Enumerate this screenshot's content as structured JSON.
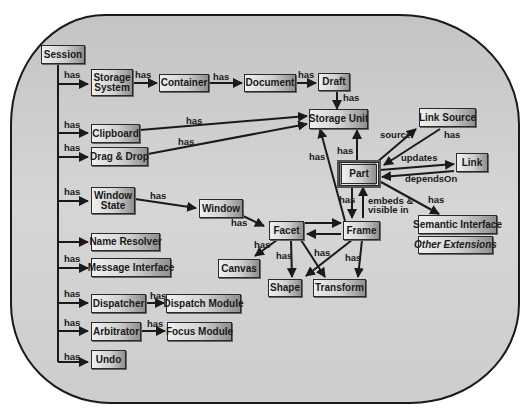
{
  "diagram": {
    "nodes": {
      "session": "Session",
      "storage_system": "Storage System",
      "container": "Container",
      "document": "Document",
      "draft": "Draft",
      "storage_unit": "Storage Unit",
      "clipboard": "Clipboard",
      "drag_drop": "Drag & Drop",
      "window_state": "Window State",
      "window": "Window",
      "facet": "Facet",
      "frame": "Frame",
      "part": "Part",
      "link_source": "Link Source",
      "link": "Link",
      "semantic_interface": "Semantic Interface",
      "other_extensions": "Other Extensions",
      "canvas": "Canvas",
      "shape": "Shape",
      "transform": "Transform",
      "name_resolver": "Name Resolver",
      "message_interface": "Message Interface",
      "dispatcher": "Dispatcher",
      "dispatch_module": "Dispatch Module",
      "arbitrator": "Arbitrator",
      "focus_module": "Focus Module",
      "undo": "Undo"
    },
    "edge_labels": {
      "has": "has",
      "source": "source",
      "updates": "updates",
      "depends_on": "dependsOn",
      "embeds": "embeds &",
      "visible_in": "visible in"
    }
  }
}
